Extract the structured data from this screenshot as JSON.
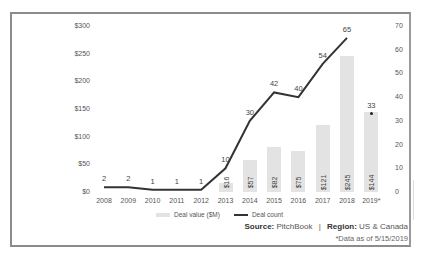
{
  "chart_data": {
    "type": "bar+line",
    "title": "",
    "categories": [
      "2008",
      "2009",
      "2010",
      "2011",
      "2012",
      "2013",
      "2014",
      "2015",
      "2016",
      "2017",
      "2018",
      "2019*"
    ],
    "series": [
      {
        "name": "Deal value ($M)",
        "type": "bar",
        "axis": "left",
        "values": [
          0,
          0,
          0,
          0,
          0,
          16,
          57,
          82,
          75,
          121,
          245,
          144
        ],
        "labels": [
          "",
          "",
          "",
          "",
          "",
          "$16",
          "$57",
          "$82",
          "$75",
          "$121",
          "$245",
          "$144"
        ]
      },
      {
        "name": "Deal count",
        "type": "line",
        "axis": "right",
        "values": [
          2,
          2,
          1,
          1,
          1,
          10,
          30,
          42,
          40,
          54,
          65,
          33
        ]
      }
    ],
    "left_axis": {
      "ticks": [
        "$0",
        "$50",
        "$100",
        "$150",
        "$200",
        "$250",
        "$300"
      ],
      "ylim": [
        0,
        300
      ]
    },
    "right_axis": {
      "ticks": [
        "0",
        "10",
        "20",
        "30",
        "40",
        "50",
        "60",
        "70"
      ],
      "ylim": [
        0,
        70
      ]
    },
    "legend": [
      "Deal value ($M)",
      "Deal count"
    ],
    "legend_position": "bottom",
    "grid": false,
    "annotations": [
      "2019 deal count shown as separate dot (33), partial year"
    ]
  },
  "footer": {
    "source_label": "Source:",
    "source_value": "PitchBook",
    "separator": "|",
    "region_label": "Region:",
    "region_value": "US & Canada",
    "note": "*Data as of 5/15/2019"
  },
  "colors": {
    "bar": "#e3e3e3",
    "line": "#333333",
    "frame": "#8c8c8c"
  }
}
